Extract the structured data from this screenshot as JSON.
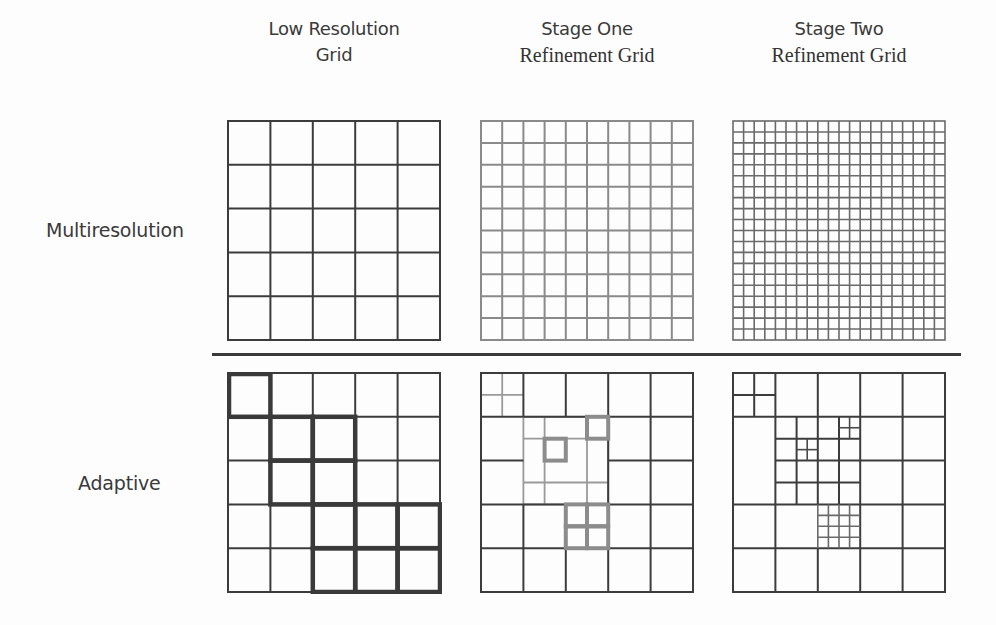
{
  "columns": [
    {
      "line1": "Low Resolution",
      "line2": "Grid",
      "line2_style": "sans"
    },
    {
      "line1": "Stage One",
      "line2": "Refinement Grid",
      "line2_style": "serif"
    },
    {
      "line1": "Stage Two",
      "line2": "Refinement Grid",
      "line2_style": "serif"
    }
  ],
  "rows": [
    {
      "label": "Multiresolution"
    },
    {
      "label": "Adaptive"
    }
  ],
  "grids": {
    "multiresolution": [
      {
        "divisions": 5,
        "stroke": "#3c3c3c"
      },
      {
        "divisions": 10,
        "stroke": "#8a8a8a"
      },
      {
        "divisions": 20,
        "stroke": "#6a6a6a"
      }
    ],
    "adaptive_base_divisions": 5,
    "adaptive_highlighted_cells_stage0": [
      [
        0,
        0
      ],
      [
        1,
        1
      ],
      [
        1,
        2
      ],
      [
        2,
        1
      ],
      [
        2,
        2
      ],
      [
        3,
        2
      ],
      [
        3,
        3
      ],
      [
        3,
        4
      ],
      [
        4,
        2
      ],
      [
        4,
        3
      ],
      [
        4,
        4
      ]
    ]
  },
  "colors": {
    "background": "#fdfdfd",
    "line_dark": "#3a3a3a",
    "line_gray": "#8a8a8a",
    "highlight": "#3a3a3a"
  }
}
